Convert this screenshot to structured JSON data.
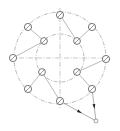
{
  "diagram": {
    "type": "mechanical-layout-sketch",
    "center": [
      60,
      58
    ],
    "outer_radius": 46,
    "inner_radius": 24,
    "colors": {
      "line": "#8a8a8a",
      "node_stroke": "#555555",
      "arrowhead": "#222222",
      "background": "#ffffff"
    },
    "outer_nodes": [
      {
        "id": "o-top",
        "x": 60,
        "y": 15
      },
      {
        "id": "o-upper-right",
        "x": 92,
        "y": 27
      },
      {
        "id": "o-right",
        "x": 106,
        "y": 59
      },
      {
        "id": "o-lower-right",
        "x": 92,
        "y": 89
      },
      {
        "id": "o-bottom",
        "x": 60,
        "y": 101
      },
      {
        "id": "o-lower-left",
        "x": 28,
        "y": 89
      },
      {
        "id": "o-left",
        "x": 13,
        "y": 58
      },
      {
        "id": "o-upper-left",
        "x": 28,
        "y": 27
      }
    ],
    "inner_nodes": [
      {
        "id": "i-upper-left",
        "x": 44,
        "y": 41
      },
      {
        "id": "i-upper-right",
        "x": 77,
        "y": 41
      },
      {
        "id": "i-lower-right",
        "x": 77,
        "y": 72
      },
      {
        "id": "i-lower-left",
        "x": 42,
        "y": 72
      }
    ],
    "edges": [
      [
        "o-top",
        "i-upper-right"
      ],
      [
        "o-upper-left",
        "i-upper-left"
      ],
      [
        "o-upper-right",
        "i-upper-right"
      ],
      [
        "o-left",
        "i-upper-left"
      ],
      [
        "o-right",
        "i-lower-right"
      ],
      [
        "o-lower-left",
        "i-lower-left"
      ],
      [
        "o-bottom",
        "i-lower-left"
      ],
      [
        "o-lower-right",
        "i-lower-right"
      ]
    ],
    "external_point": {
      "id": "p-external",
      "x": 96,
      "y": 121
    },
    "arrows": [
      {
        "from": "o-bottom",
        "to": "p-external"
      },
      {
        "from": "o-lower-right",
        "to": "p-external"
      }
    ]
  }
}
